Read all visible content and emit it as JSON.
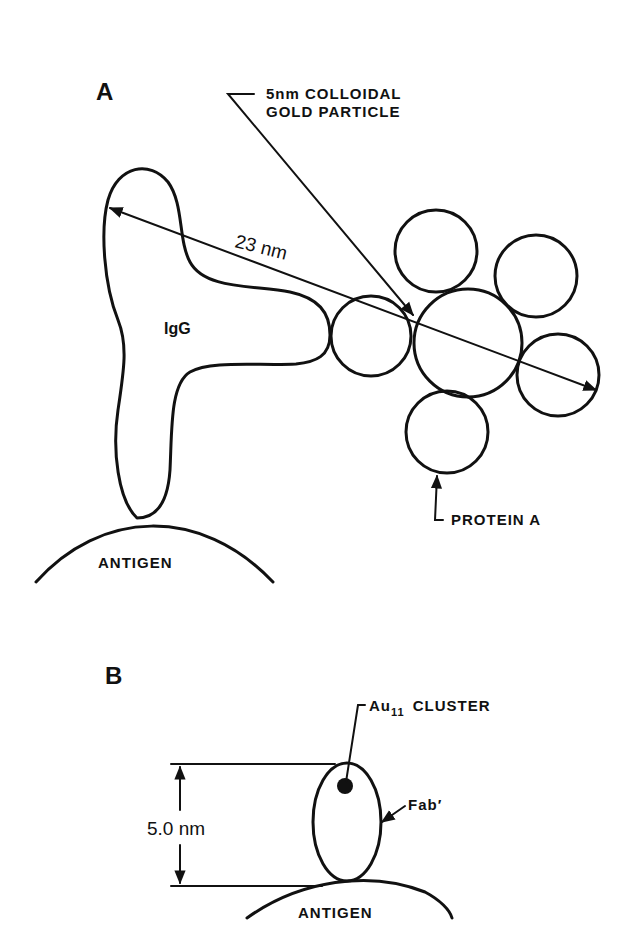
{
  "figure": {
    "panel_a": {
      "label": "A",
      "callout_gold": [
        "5nm COLLOIDAL",
        "GOLD PARTICLE"
      ],
      "measurement": "23 nm",
      "antibody_label": "IgG",
      "protein_label": "PROTEIN A",
      "antigen_label": "ANTIGEN"
    },
    "panel_b": {
      "label": "B",
      "cluster_label_main": "Au",
      "cluster_label_sub": "11",
      "cluster_label_rest": "CLUSTER",
      "fragment_label": "Fab′",
      "measurement": "5.0 nm",
      "antigen_label": "ANTIGEN"
    },
    "colors": {
      "ink": "#111111",
      "background": "#ffffff"
    }
  }
}
